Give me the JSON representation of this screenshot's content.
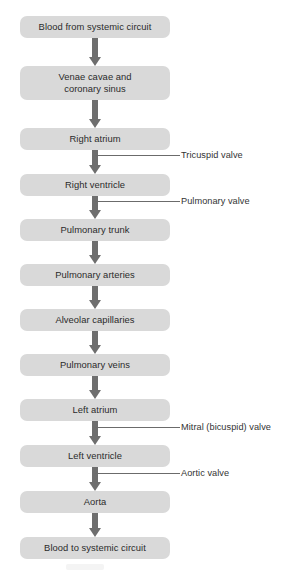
{
  "diagram": {
    "box_fill_color": "#d9d9d9",
    "arrow_color": "#6e6e6e",
    "text_color": "#2b2b2b",
    "leader_color": "#6b6b6b",
    "background_color": "#ffffff",
    "nodes": [
      {
        "id": "blood-from-systemic-circuit",
        "label": "Blood from systemic circuit",
        "top": 16,
        "height": 22
      },
      {
        "id": "venae-cavae-and-coronary-sinus",
        "label": "Venae cavae and\ncoronary sinus",
        "top": 66,
        "height": 34
      },
      {
        "id": "right-atrium",
        "label": "Right atrium",
        "top": 128,
        "height": 22
      },
      {
        "id": "right-ventricle",
        "label": "Right ventricle",
        "top": 174,
        "height": 22
      },
      {
        "id": "pulmonary-trunk",
        "label": "Pulmonary trunk",
        "top": 219,
        "height": 22
      },
      {
        "id": "pulmonary-arteries",
        "label": "Pulmonary arteries",
        "top": 264,
        "height": 22
      },
      {
        "id": "alveolar-capillaries",
        "label": "Alveolar capillaries",
        "top": 309,
        "height": 22
      },
      {
        "id": "pulmonary-veins",
        "label": "Pulmonary veins",
        "top": 354,
        "height": 22
      },
      {
        "id": "left-atrium",
        "label": "Left atrium",
        "top": 399,
        "height": 22
      },
      {
        "id": "left-ventricle",
        "label": "Left ventricle",
        "top": 445,
        "height": 22
      },
      {
        "id": "aorta",
        "label": "Aorta",
        "top": 491,
        "height": 22
      },
      {
        "id": "blood-to-systemic-circuit",
        "label": "Blood to systemic circuit",
        "top": 537,
        "height": 22
      }
    ],
    "arrows": [
      {
        "id": "arrow-1",
        "top": 38,
        "height": 28
      },
      {
        "id": "arrow-2",
        "top": 100,
        "height": 28
      },
      {
        "id": "arrow-3",
        "top": 150,
        "height": 24
      },
      {
        "id": "arrow-4",
        "top": 196,
        "height": 23
      },
      {
        "id": "arrow-5",
        "top": 241,
        "height": 23
      },
      {
        "id": "arrow-6",
        "top": 286,
        "height": 23
      },
      {
        "id": "arrow-7",
        "top": 331,
        "height": 23
      },
      {
        "id": "arrow-8",
        "top": 376,
        "height": 23
      },
      {
        "id": "arrow-9",
        "top": 421,
        "height": 24
      },
      {
        "id": "arrow-10",
        "top": 467,
        "height": 24
      },
      {
        "id": "arrow-11",
        "top": 513,
        "height": 24
      }
    ],
    "callouts": [
      {
        "id": "tricuspid-valve",
        "label": "Tricuspid valve",
        "line_top": 155,
        "line_left": 95,
        "line_width": 85,
        "text_left": 181,
        "text_top": 150
      },
      {
        "id": "pulmonary-valve",
        "label": "Pulmonary valve",
        "line_top": 201,
        "line_left": 95,
        "line_width": 85,
        "text_left": 181,
        "text_top": 196
      },
      {
        "id": "mitral-bicuspid-valve",
        "label": "Mitral (bicuspid) valve",
        "line_top": 427,
        "line_left": 95,
        "line_width": 85,
        "text_left": 181,
        "text_top": 422
      },
      {
        "id": "aortic-valve",
        "label": "Aortic valve",
        "line_top": 473,
        "line_left": 95,
        "line_width": 85,
        "text_left": 181,
        "text_top": 468
      }
    ]
  }
}
